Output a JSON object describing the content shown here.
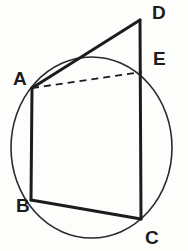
{
  "figure": {
    "background_color": "#fdfdfc",
    "stroke_color": "#1c1c1c",
    "circle_color": "#2a2a2a",
    "circle": {
      "label": "circumscribed-circle",
      "cx": 91.5,
      "cy": 147.5,
      "rx": 80.5,
      "ry": 90.5,
      "stroke_width": 1.6
    },
    "points": [
      {
        "id": "A",
        "label": "A",
        "x": 32,
        "y": 88,
        "label_x": 13,
        "label_y": 69
      },
      {
        "id": "B",
        "label": "B",
        "x": 31,
        "y": 200,
        "label_x": 16,
        "label_y": 196
      },
      {
        "id": "C",
        "label": "C",
        "x": 141,
        "y": 219,
        "label_x": 145,
        "label_y": 228
      },
      {
        "id": "D",
        "label": "D",
        "x": 140,
        "y": 20,
        "label_x": 152,
        "label_y": 3
      },
      {
        "id": "E",
        "label": "E",
        "x": 142,
        "y": 72,
        "label_x": 153,
        "label_y": 49
      }
    ],
    "segments": [
      {
        "id": "AD",
        "from": "A",
        "to": "D",
        "style": "solid",
        "stroke_width": 3.0
      },
      {
        "id": "DC",
        "from": "D",
        "to": "C",
        "style": "solid",
        "stroke_width": 3.0
      },
      {
        "id": "AB",
        "from": "A",
        "to": "B",
        "style": "solid",
        "stroke_width": 3.0
      },
      {
        "id": "BC",
        "from": "B",
        "to": "C",
        "style": "solid",
        "stroke_width": 3.0
      },
      {
        "id": "AE",
        "from": "A",
        "to": "E",
        "style": "dashed",
        "stroke_width": 1.8,
        "dash_pattern": "7 5"
      }
    ]
  }
}
